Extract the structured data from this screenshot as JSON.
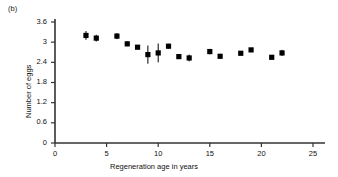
{
  "panel": {
    "label": "(b)"
  },
  "chart_data": {
    "type": "scatter",
    "title": "",
    "xlabel": "Regeneration age in years",
    "ylabel": "Number of eggs",
    "xlim": [
      0,
      25
    ],
    "ylim": [
      0,
      3.6
    ],
    "xticks": [
      0,
      5,
      10,
      15,
      20,
      25
    ],
    "xtick_labels": [
      "0",
      "5",
      "10",
      "15",
      "20",
      "25"
    ],
    "yticks": [
      0,
      0.6,
      1.2,
      1.8,
      2.4,
      3,
      3.6
    ],
    "ytick_labels": [
      "0",
      "0.6",
      "1.2",
      "1.8",
      "2.4",
      "3",
      "3.6"
    ],
    "grid": false,
    "legend": null,
    "marker": "filled-square",
    "marker_color": "#000000",
    "errorbar_color": "#000000",
    "x": [
      3,
      4,
      6,
      7,
      8,
      9,
      10,
      11,
      12,
      13,
      15,
      16,
      18,
      19,
      21,
      22
    ],
    "y": [
      3.2,
      3.12,
      3.18,
      2.95,
      2.85,
      2.63,
      2.68,
      2.88,
      2.57,
      2.53,
      2.72,
      2.58,
      2.67,
      2.77,
      2.55,
      2.68
    ],
    "yerr": [
      0.13,
      0.1,
      0.09,
      0.07,
      0.05,
      0.27,
      0.28,
      0.07,
      0.07,
      0.1,
      0.08,
      0.06,
      0.05,
      0.05,
      0.05,
      0.09
    ]
  }
}
